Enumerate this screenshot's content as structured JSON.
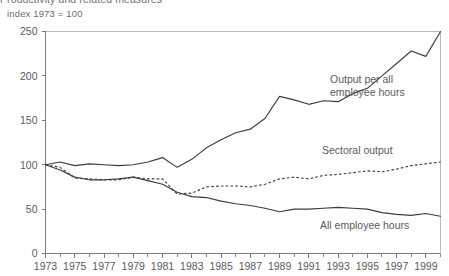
{
  "header": {
    "title": "Productivity and related measures",
    "subtitle": "index 1973 = 100"
  },
  "chart_data": {
    "type": "line",
    "title": "Productivity and related measures",
    "subtitle": "index 1973 = 100",
    "xlabel": "",
    "ylabel": "",
    "xlim": [
      1973,
      2000
    ],
    "ylim": [
      0,
      250
    ],
    "yticks": [
      0,
      50,
      100,
      150,
      200,
      250
    ],
    "xticks": [
      1973,
      1975,
      1977,
      1979,
      1981,
      1983,
      1985,
      1987,
      1989,
      1991,
      1993,
      1995,
      1997,
      1999
    ],
    "xticks_minor_every": 1,
    "grid": false,
    "legend": "inline-annotations",
    "x": [
      1973,
      1974,
      1975,
      1976,
      1977,
      1978,
      1979,
      1980,
      1981,
      1982,
      1983,
      1984,
      1985,
      1986,
      1987,
      1988,
      1989,
      1990,
      1991,
      1992,
      1993,
      1994,
      1995,
      1996,
      1997,
      1998,
      1999,
      2000
    ],
    "series": [
      {
        "name": "Output per all employee hours",
        "style": "solid",
        "values": [
          100,
          103,
          99,
          101,
          100,
          99,
          100,
          103,
          108,
          97,
          106,
          119,
          128,
          136,
          140,
          152,
          177,
          173,
          168,
          172,
          171,
          180,
          186,
          200,
          214,
          228,
          222,
          250
        ]
      },
      {
        "name": "Sectoral output",
        "style": "dashed",
        "values": [
          100,
          97,
          85,
          84,
          83,
          83,
          86,
          84,
          84,
          67,
          68,
          75,
          76,
          76,
          75,
          78,
          84,
          86,
          84,
          88,
          89,
          91,
          93,
          92,
          95,
          99,
          101,
          103
        ]
      },
      {
        "name": "All employee hours",
        "style": "solid",
        "values": [
          100,
          94,
          86,
          83,
          83,
          84,
          86,
          82,
          78,
          69,
          64,
          63,
          59,
          56,
          54,
          51,
          47,
          50,
          50,
          51,
          52,
          51,
          50,
          46,
          44,
          43,
          45,
          42
        ]
      }
    ],
    "annotations": [
      {
        "text_line1": "Output per all",
        "text_line2": "employee hours",
        "x_px": 330,
        "y_px": 83
      },
      {
        "text_line1": "Sectoral output",
        "text_line2": "",
        "x_px": 322,
        "y_px": 154
      },
      {
        "text_line1": "All employee hours",
        "text_line2": "",
        "x_px": 320,
        "y_px": 229
      }
    ]
  }
}
